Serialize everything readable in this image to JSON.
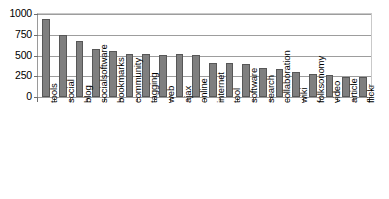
{
  "chart_data": {
    "type": "bar",
    "title": "",
    "subtitle": "",
    "xlabel": "",
    "ylabel": "",
    "grid": true,
    "legend": "none",
    "ylim": [
      0,
      1000
    ],
    "y_ticks": [
      0,
      250,
      500,
      750,
      1000
    ],
    "y_tick_labels": [
      "0",
      "250",
      "500",
      "750",
      "1000"
    ],
    "categories": [
      "tools",
      "social",
      "blog",
      "socialsoftware",
      "bookmarks",
      "community",
      "tagging",
      "web",
      "ajax",
      "online",
      "internet",
      "tool",
      "software",
      "search",
      "collaboration",
      "wiki",
      "folksonomy",
      "video",
      "article",
      "flickr"
    ],
    "values": [
      945,
      750,
      670,
      580,
      550,
      520,
      520,
      510,
      515,
      505,
      415,
      405,
      395,
      350,
      340,
      305,
      280,
      270,
      245,
      240
    ],
    "bar_color": "#7f7f7f",
    "bar_edge_color": "#575757",
    "gridline_color": "#9d9d9d",
    "axis_color": "#9a9a9a",
    "background_color": "#ffffff"
  }
}
